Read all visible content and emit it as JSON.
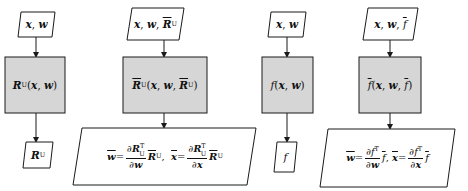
{
  "colors": {
    "process_fill": "#d6d6d6",
    "stroke": "#1a1a1a",
    "background": "#ffffff"
  },
  "columns": [
    {
      "id": "primal-vjp",
      "input": {
        "text": "x, w",
        "parts": [
          "x",
          "w"
        ]
      },
      "process": {
        "text": "R_U(x, w)"
      },
      "output": {
        "text": "R_U"
      }
    },
    {
      "id": "adjoint-vjp",
      "input": {
        "text": "x, w, R̄_U",
        "parts": [
          "x",
          "w",
          "R̄_U"
        ]
      },
      "process": {
        "text": "R̄_U(x, w, R̄_U)"
      },
      "output": {
        "text": "w̄ = (∂R_U^T/∂w) R̄_U,  x̄ = (∂R_U^T/∂x) R̄_U",
        "w_bar_num": "∂R",
        "w_bar_den": "∂w",
        "x_bar_num": "∂R",
        "x_bar_den": "∂x"
      }
    },
    {
      "id": "primal-f",
      "input": {
        "text": "x, w",
        "parts": [
          "x",
          "w"
        ]
      },
      "process": {
        "text": "f(x, w)"
      },
      "output": {
        "text": "f"
      }
    },
    {
      "id": "adjoint-f",
      "input": {
        "text": "x, w, f̄",
        "parts": [
          "x",
          "w",
          "f̄"
        ]
      },
      "process": {
        "text": "f̄(x, w, f̄)"
      },
      "output": {
        "text": "w̄ = (∂f^T/∂w) f̄,  x̄ = (∂f^T/∂x) f̄",
        "w_bar_num": "∂f",
        "w_bar_den": "∂w",
        "x_bar_num": "∂f",
        "x_bar_den": "∂x"
      }
    }
  ],
  "symbols": {
    "x": "x",
    "w": "w",
    "R": "R",
    "f": "f",
    "U": "U",
    "T": "T",
    "comma": ",",
    "lparen": "(",
    "rparen": ")",
    "eq": "=",
    "partial": "∂"
  }
}
